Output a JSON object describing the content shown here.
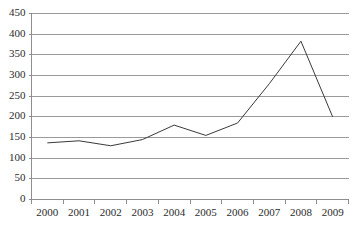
{
  "chart_data": {
    "type": "line",
    "title": "",
    "subtitle": "",
    "xlabel": "",
    "ylabel": "",
    "categories": [
      "2000",
      "2001",
      "2002",
      "2003",
      "2004",
      "2005",
      "2006",
      "2007",
      "2008",
      "2009"
    ],
    "series": [
      {
        "name": "",
        "values": [
          137,
          142,
          130,
          145,
          180,
          155,
          185,
          280,
          383,
          200
        ]
      }
    ],
    "ylim": [
      0,
      450
    ],
    "ytick_step": 50,
    "ytick_labels": [
      "0",
      "50",
      "100",
      "150",
      "200",
      "250",
      "300",
      "350",
      "400",
      "450"
    ],
    "grid": true,
    "grid_axis": "y",
    "legend": false,
    "legend_position": "none",
    "markers": false,
    "colors": {
      "line": "#3a3a3a",
      "grid": "#9a9a9a",
      "axis": "#8e8e8e",
      "text": "#2b2b2b",
      "background": "#ffffff"
    }
  }
}
